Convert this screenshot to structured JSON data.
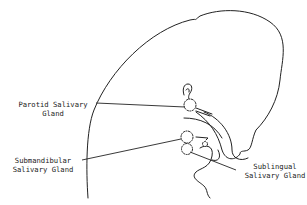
{
  "diagram": {
    "line_color": "#222222",
    "background": "#ffffff",
    "labels": {
      "parotid": {
        "line1": "Parotid Salivary",
        "line2": "Gland"
      },
      "submandibular": {
        "line1": "Submandibular",
        "line2": "Salivary Gland"
      },
      "sublingual": {
        "line1": "Sublingual",
        "line2": "Salivary Gland"
      }
    }
  }
}
